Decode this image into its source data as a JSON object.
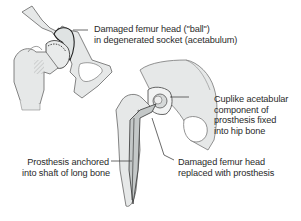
{
  "diagram": {
    "figures": [
      {
        "id": "hip-before",
        "description": "Hip joint with degenerated socket"
      },
      {
        "id": "hip-after",
        "description": "Hip joint with prosthesis"
      }
    ],
    "labels": [
      {
        "id": "damaged-femur-head",
        "lines": [
          "Damaged femur head (\"ball\")",
          "in degenerated socket (acetabulum)"
        ]
      },
      {
        "id": "cup-component",
        "lines": [
          "Cuplike acetabular",
          "component of",
          "prosthesis fixed",
          "into hip bone"
        ]
      },
      {
        "id": "prosthesis-anchored",
        "lines": [
          "Prosthesis anchored",
          "into shaft of long bone"
        ]
      },
      {
        "id": "femur-head-replaced",
        "lines": [
          "Damaged femur head",
          "replaced with prosthesis"
        ]
      }
    ],
    "colors": {
      "bone_fill": "#e6e8e8",
      "bone_stroke": "#555555",
      "leader_line": "#444444",
      "text": "#2a2a2a"
    }
  }
}
